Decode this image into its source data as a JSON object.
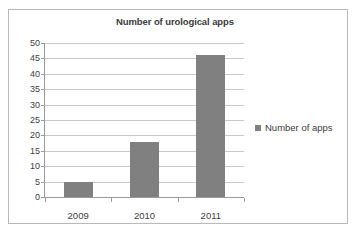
{
  "chart_data": {
    "type": "bar",
    "title": "Number of urological apps",
    "xlabel": "",
    "ylabel": "",
    "categories": [
      "2009",
      "2010",
      "2011"
    ],
    "series": [
      {
        "name": "Number of apps",
        "values": [
          5,
          18,
          46
        ]
      }
    ],
    "ylim": [
      0,
      50
    ],
    "ytick_step": 5,
    "yticks": [
      "50",
      "45",
      "40",
      "35",
      "30",
      "25",
      "20",
      "15",
      "10",
      "5",
      "0"
    ],
    "grid": true,
    "legend_position": "right",
    "colors": {
      "bar": "#808080",
      "gridline": "#c8c8c8",
      "axis": "#9a9a9a",
      "text": "#404040",
      "title_text": "#3b3b3b",
      "frame_border": "#b9b9b9",
      "background": "#ffffff"
    }
  },
  "legend": {
    "entries": [
      {
        "label": "Number of apps",
        "swatch_name": "legend-swatch-number-of-apps"
      }
    ]
  }
}
